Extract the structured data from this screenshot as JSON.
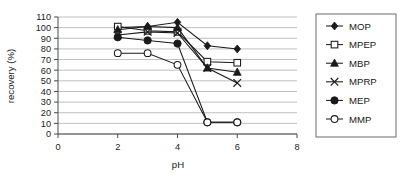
{
  "chart_data": {
    "type": "line",
    "title": "",
    "xlabel": "pH",
    "ylabel": "recovery (%)",
    "x": [
      2,
      3,
      4,
      5,
      6
    ],
    "xlim": [
      0,
      8
    ],
    "ylim": [
      0,
      110
    ],
    "xticks": [
      0,
      2,
      4,
      6,
      8
    ],
    "yticks": [
      0,
      10,
      20,
      30,
      40,
      50,
      60,
      70,
      80,
      90,
      100,
      110
    ],
    "grid": "horizontal",
    "legend_position": "right",
    "series": [
      {
        "name": "MOP",
        "marker": "filled-diamond",
        "values": [
          100,
          101,
          105,
          83,
          80
        ]
      },
      {
        "name": "MPEP",
        "marker": "open-square",
        "values": [
          101,
          97,
          96,
          68,
          67
        ]
      },
      {
        "name": "MBP",
        "marker": "filled-triangle",
        "values": [
          98,
          101,
          100,
          62,
          58
        ]
      },
      {
        "name": "MPRP",
        "marker": "cross-x",
        "values": [
          93,
          96,
          95,
          62,
          48
        ]
      },
      {
        "name": "MEP",
        "marker": "filled-circle",
        "values": [
          91,
          88,
          85,
          11,
          11
        ]
      },
      {
        "name": "MMP",
        "marker": "open-circle",
        "values": [
          76,
          76,
          65,
          11,
          11
        ]
      }
    ]
  },
  "legend": {
    "items": [
      {
        "label": "MOP"
      },
      {
        "label": "MPEP"
      },
      {
        "label": "MBP"
      },
      {
        "label": "MPRP"
      },
      {
        "label": "MEP"
      },
      {
        "label": "MMP"
      }
    ]
  },
  "axes": {
    "y_title": "recovery (%)",
    "x_title": "pH",
    "y_labels": [
      "110",
      "100",
      "90",
      "80",
      "70",
      "60",
      "50",
      "40",
      "30",
      "20",
      "10",
      "0"
    ],
    "x_labels": [
      "0",
      "2",
      "4",
      "6",
      "8"
    ]
  }
}
